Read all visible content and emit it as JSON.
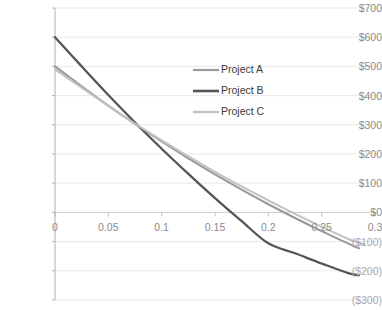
{
  "chart_data": {
    "type": "line",
    "title": "",
    "xlabel": "",
    "ylabel": "",
    "xlim": [
      0,
      0.3
    ],
    "ylim": [
      -300,
      700
    ],
    "grid": true,
    "legend_position": "inside-top-center",
    "x_ticks": [
      "0",
      "0.05",
      "0.1",
      "0.15",
      "0.2",
      "0.25",
      "0.3"
    ],
    "x_tick_values": [
      0,
      0.05,
      0.1,
      0.15,
      0.2,
      0.25,
      0.3
    ],
    "y_ticks": [
      "$700",
      "$600",
      "$500",
      "$400",
      "$300",
      "$200",
      "$100",
      "$0",
      "($100)",
      "($200)",
      "($300)"
    ],
    "y_tick_values": [
      700,
      600,
      500,
      400,
      300,
      200,
      100,
      0,
      -100,
      -200,
      -300
    ],
    "series": [
      {
        "name": "Project A",
        "color": "#9a9a9a",
        "width": 2.1,
        "x": [
          0,
          0.025,
          0.05,
          0.075,
          0.1,
          0.125,
          0.15,
          0.175,
          0.2,
          0.225,
          0.25,
          0.275,
          0.285
        ],
        "values": [
          500,
          432,
          366,
          303,
          243,
          185,
          130,
          78,
          28,
          -19,
          -64,
          -107,
          -123
        ]
      },
      {
        "name": "Project B",
        "color": "#555555",
        "width": 2.3,
        "x": [
          0,
          0.025,
          0.05,
          0.075,
          0.1,
          0.125,
          0.15,
          0.175,
          0.2,
          0.225,
          0.25,
          0.275,
          0.285
        ],
        "values": [
          600,
          500,
          402,
          308,
          218,
          132,
          49,
          -30,
          -106,
          -140,
          -175,
          -208,
          -215
        ]
      },
      {
        "name": "Project C",
        "color": "#c2c2c2",
        "width": 2.1,
        "x": [
          0,
          0.025,
          0.05,
          0.075,
          0.1,
          0.125,
          0.15,
          0.175,
          0.2,
          0.225,
          0.25,
          0.275,
          0.29
        ],
        "values": [
          490,
          427,
          364,
          304,
          247,
          192,
          139,
          89,
          41,
          -5,
          -49,
          -91,
          -110
        ]
      }
    ]
  },
  "legend": {
    "items": [
      {
        "label": "Project A",
        "color": "#9a9a9a"
      },
      {
        "label": "Project B",
        "color": "#555555"
      },
      {
        "label": "Project C",
        "color": "#c2c2c2"
      }
    ]
  },
  "axes": {
    "x_labels": [
      "0",
      "0.05",
      "0.1",
      "0.15",
      "0.2",
      "0.25",
      "0.3"
    ],
    "y_labels": [
      "$700",
      "$600",
      "$500",
      "$400",
      "$300",
      "$200",
      "$100",
      "$0",
      "($100)",
      "($200)",
      "($300)"
    ]
  },
  "colors": {
    "grid": "#e9e9e9",
    "axis": "#b0b0b0",
    "tick_text": "#8c8c8c",
    "legend_text": "#3a3a3a",
    "background": "#ffffff"
  }
}
